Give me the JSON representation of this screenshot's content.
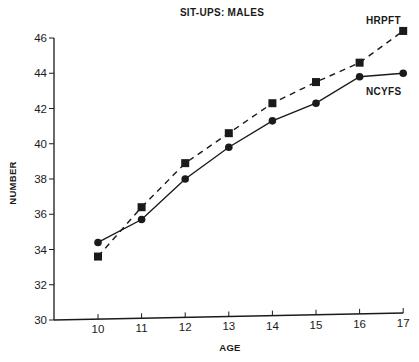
{
  "chart_data": {
    "type": "line",
    "title": "SIT-UPS: MALES",
    "xlabel": "AGE",
    "ylabel": "NUMBER",
    "x": [
      10,
      11,
      12,
      13,
      14,
      15,
      16,
      17
    ],
    "x_tick_labels": [
      "10",
      "11",
      "12",
      "13",
      "14",
      "15",
      "16",
      "17"
    ],
    "y_ticks": [
      30,
      32,
      34,
      36,
      38,
      40,
      42,
      44,
      46
    ],
    "y_tick_labels": [
      "30",
      "32",
      "34",
      "36",
      "38",
      "40",
      "42",
      "44",
      "46"
    ],
    "ylim": [
      30,
      46
    ],
    "xlim": [
      9,
      17
    ],
    "grid": false,
    "legend_position": "inline-right",
    "series": [
      {
        "name": "HRPFT",
        "marker": "square",
        "line_style": "dashed",
        "values": [
          33.6,
          36.4,
          38.9,
          40.6,
          42.3,
          43.5,
          44.6,
          46.4
        ]
      },
      {
        "name": "NCYFS",
        "marker": "circle",
        "line_style": "solid",
        "values": [
          34.4,
          35.7,
          38.0,
          39.8,
          41.3,
          42.3,
          43.8,
          44.0
        ]
      }
    ]
  }
}
